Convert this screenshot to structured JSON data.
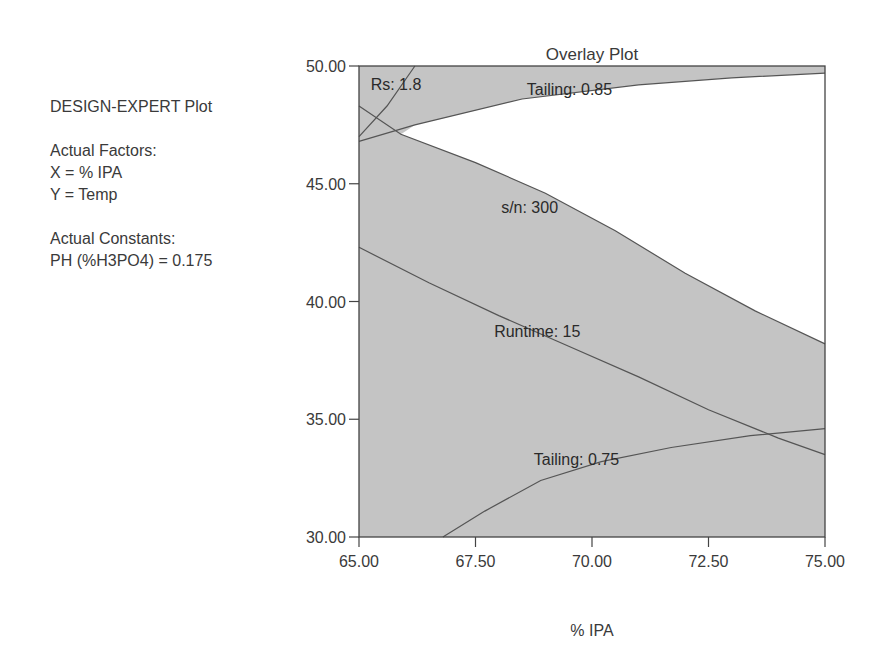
{
  "info_panel": {
    "heading": "DESIGN-EXPERT Plot",
    "factors_heading": "Actual Factors:",
    "x_factor": "X = % IPA",
    "y_factor": "Y = Temp",
    "constants_heading": "Actual Constants:",
    "constant_1": "PH (%H3PO4) = 0.175"
  },
  "chart_data": {
    "type": "overlay-contour",
    "title": "Overlay Plot",
    "xlabel": "% IPA",
    "ylabel": "",
    "xlim": [
      65.0,
      75.0
    ],
    "ylim": [
      30.0,
      50.0
    ],
    "x_ticks": [
      "65.00",
      "67.50",
      "70.00",
      "72.50",
      "75.00"
    ],
    "y_ticks": [
      "30.00",
      "35.00",
      "40.00",
      "45.00",
      "50.00"
    ],
    "shaded_color": "#c4c4c4",
    "sweet_spot_color": "#ffffff",
    "contours": [
      {
        "label": "Rs: 1.8",
        "points": [
          [
            65.0,
            47.0
          ],
          [
            65.6,
            48.3
          ],
          [
            66.2,
            50.0
          ]
        ]
      },
      {
        "label": "Tailing: 0.85",
        "points": [
          [
            65.0,
            46.8
          ],
          [
            66.2,
            47.5
          ],
          [
            68.5,
            48.6
          ],
          [
            71.0,
            49.2
          ],
          [
            73.0,
            49.5
          ],
          [
            75.0,
            49.7
          ]
        ]
      },
      {
        "label": "s/n: 300",
        "points": [
          [
            65.0,
            48.3
          ],
          [
            65.9,
            47.1
          ],
          [
            67.5,
            45.9
          ],
          [
            69.0,
            44.6
          ],
          [
            70.5,
            43.0
          ],
          [
            72.0,
            41.2
          ],
          [
            73.5,
            39.6
          ],
          [
            75.0,
            38.2
          ]
        ]
      },
      {
        "label": "Runtime: 15",
        "points": [
          [
            65.0,
            42.3
          ],
          [
            66.5,
            40.8
          ],
          [
            68.0,
            39.4
          ],
          [
            69.5,
            38.1
          ],
          [
            71.0,
            36.8
          ],
          [
            72.5,
            35.4
          ],
          [
            74.0,
            34.2
          ],
          [
            75.0,
            33.5
          ]
        ]
      },
      {
        "label": "Tailing: 0.75",
        "points": [
          [
            66.8,
            30.0
          ],
          [
            67.7,
            31.1
          ],
          [
            68.9,
            32.4
          ],
          [
            70.2,
            33.2
          ],
          [
            71.7,
            33.8
          ],
          [
            73.4,
            34.3
          ],
          [
            75.0,
            34.6
          ]
        ]
      }
    ],
    "label_positions": [
      {
        "label": "Rs: 1.8",
        "x": 65.25,
        "y": 49.0
      },
      {
        "label": "Tailing: 0.85",
        "x": 68.6,
        "y": 48.75
      },
      {
        "label": "s/n: 300",
        "x": 68.05,
        "y": 43.75
      },
      {
        "label": "Runtime: 15",
        "x": 67.9,
        "y": 38.5
      },
      {
        "label": "Tailing: 0.75",
        "x": 68.75,
        "y": 33.05
      }
    ],
    "grid": false,
    "legend": "none"
  }
}
